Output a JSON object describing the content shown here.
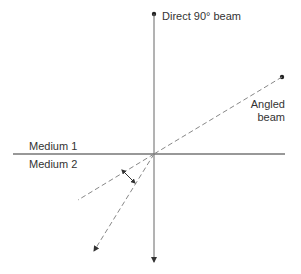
{
  "diagram": {
    "labels": {
      "direct_beam": "Direct 90° beam",
      "angled_beam_line1": "Angled",
      "angled_beam_line2": "beam",
      "medium1": "Medium 1",
      "medium2": "Medium 2"
    },
    "colors": {
      "line": "#555555",
      "boundary": "#333333",
      "dashed": "#888888",
      "text": "#333333",
      "background": "#ffffff"
    },
    "elements": [
      {
        "id": "boundary",
        "type": "solid-line",
        "from": [
          13,
          154
        ],
        "to": [
          285,
          154
        ]
      },
      {
        "id": "direct-beam",
        "type": "solid-arrow",
        "from": [
          154,
          14
        ],
        "to": [
          154,
          262
        ]
      },
      {
        "id": "angled-incident",
        "type": "dashed-line",
        "from": [
          282,
          77
        ],
        "to": [
          154,
          154
        ]
      },
      {
        "id": "angled-continuation",
        "type": "dashed-line",
        "from": [
          154,
          154
        ],
        "to": [
          78,
          200
        ]
      },
      {
        "id": "refracted-beam",
        "type": "dashed-arrow",
        "from": [
          154,
          154
        ],
        "to": [
          94,
          251
        ]
      },
      {
        "id": "refraction-angle",
        "type": "double-arrow",
        "from": [
          124,
          172
        ],
        "to": [
          136,
          183
        ]
      }
    ]
  }
}
